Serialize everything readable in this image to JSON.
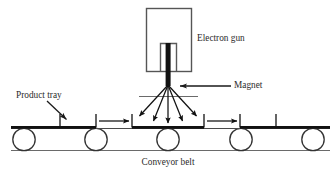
{
  "diagram": {
    "labels": {
      "electron_gun": "Electron gun",
      "magnet": "Magnet",
      "product_tray": "Product tray",
      "conveyor_belt": "Conveyor belt"
    },
    "colors": {
      "line": "#1a1a1a",
      "beam": "#111111",
      "gun_body_stroke": "#555555",
      "roller_stroke": "#333333",
      "belt_stroke": "#555555",
      "text": "#2b2b2b",
      "background": "#ffffff"
    },
    "components": {
      "electron_gun": {
        "shape": "rectangle",
        "x": 146,
        "y": 8,
        "width": 45,
        "height": 63
      },
      "gun_nozzle": {
        "shape": "vertical-bar",
        "center_x": 168,
        "top_y": 43,
        "bottom_y": 85,
        "width": 5
      },
      "nozzle_shroud": {
        "shape": "open-rectangle",
        "x": 160,
        "y": 43,
        "width": 16,
        "height": 28
      },
      "magnet_bar": {
        "shape": "horizontal-line",
        "x1": 140,
        "x2": 198,
        "y": 96
      },
      "beam_origin": {
        "x": 168,
        "y": 85
      },
      "beam_rays": {
        "count": 5,
        "end_points": [
          {
            "x": 139,
            "y": 117
          },
          {
            "x": 153,
            "y": 122
          },
          {
            "x": 168,
            "y": 124
          },
          {
            "x": 183,
            "y": 122
          },
          {
            "x": 197,
            "y": 117
          }
        ]
      },
      "conveyor": {
        "belt_top_y": 128,
        "belt_bottom_y": 150,
        "belt_x1": 10,
        "belt_x2": 330,
        "roller_radius": 11,
        "roller_center_y": 139,
        "roller_centers_x": [
          24,
          96,
          168,
          241,
          313
        ]
      },
      "trays": {
        "count": 5,
        "top_y": 128,
        "wall_height": 14,
        "items": [
          {
            "x1": 10,
            "x2": 60,
            "left_wall": false,
            "right_wall": true
          },
          {
            "x1": 60,
            "x2": 96,
            "left_wall": true,
            "right_wall": false
          },
          {
            "x1": 132,
            "x2": 204,
            "left_wall": true,
            "right_wall": true
          },
          {
            "x1": 240,
            "x2": 276,
            "left_wall": true,
            "right_wall": false
          },
          {
            "x1": 276,
            "x2": 330,
            "left_wall": false,
            "right_wall": true
          }
        ]
      },
      "motion_arrows": [
        {
          "x1": 99,
          "x2": 130,
          "y": 121
        },
        {
          "x1": 207,
          "x2": 238,
          "y": 121
        }
      ],
      "pointer_electron_gun": {
        "note": "label sits to the right of gun body, no leader line"
      },
      "pointer_magnet": {
        "from_x": 231,
        "to_x": 179,
        "y": 86
      },
      "pointer_product_tray": {
        "from_x": 48,
        "from_y": 101,
        "to_x": 66,
        "to_y": 119
      }
    },
    "label_positions": {
      "electron_gun": {
        "x": 197,
        "y": 39
      },
      "magnet": {
        "x": 234,
        "y": 86
      },
      "product_tray": {
        "x": 16,
        "y": 96
      },
      "conveyor_belt": {
        "x": 134,
        "y": 162
      }
    }
  }
}
